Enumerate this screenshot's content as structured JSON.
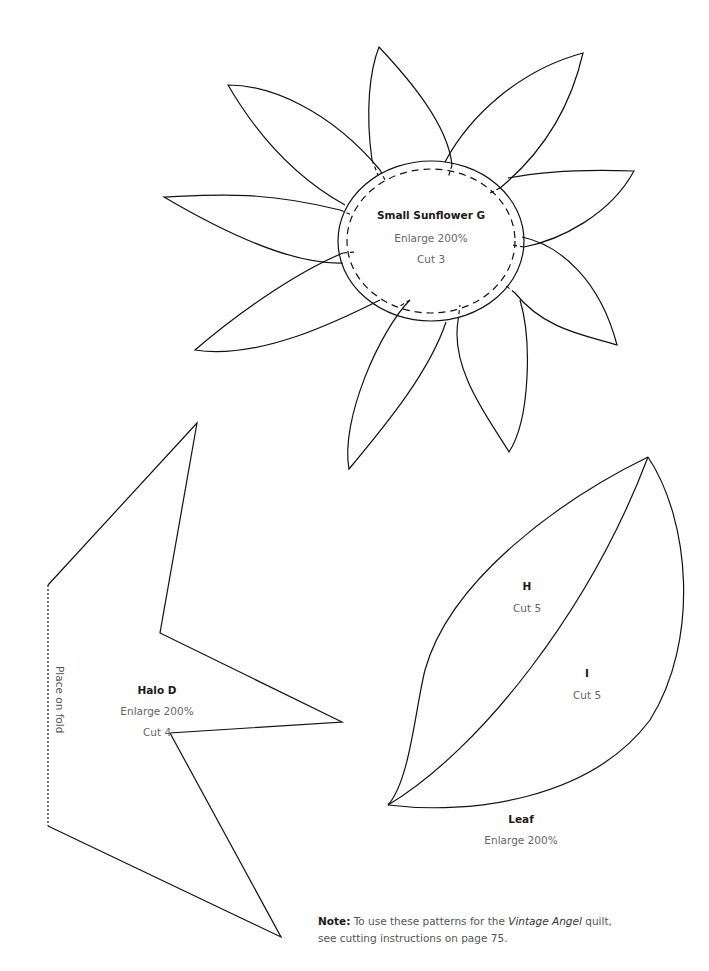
{
  "sunflower": {
    "title": "Small Sunflower G",
    "enlarge": "Enlarge 200%",
    "cut": "Cut 3"
  },
  "halo": {
    "title": "Halo D",
    "enlarge": "Enlarge 200%",
    "cut": "Cut 4",
    "fold_label": "Place on fold"
  },
  "leaf": {
    "title": "Leaf",
    "enlarge": "Enlarge 200%",
    "piece_h": {
      "title": "H",
      "cut": "Cut 5"
    },
    "piece_i": {
      "title": "I",
      "cut": "Cut 5"
    }
  },
  "note": {
    "label": "Note:",
    "text_before": " To use these patterns for the ",
    "quilt_name": "Vintage Angel",
    "text_after": " quilt, see cutting instructions on page 75."
  },
  "colors": {
    "line": "#111111",
    "background": "#ffffff",
    "text_secondary": "#666666"
  }
}
